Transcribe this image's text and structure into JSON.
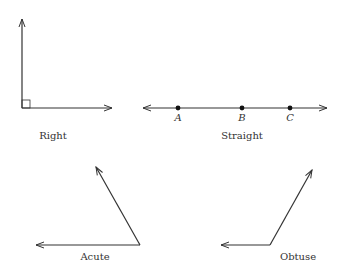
{
  "diagram": {
    "angles": [
      {
        "type": "right",
        "label": "Right"
      },
      {
        "type": "straight",
        "label": "Straight",
        "points": [
          "A",
          "B",
          "C"
        ]
      },
      {
        "type": "acute",
        "label": "Acute"
      },
      {
        "type": "obtuse",
        "label": "Obtuse"
      }
    ]
  },
  "colors": {
    "line": "#333333",
    "background": "#ffffff"
  }
}
